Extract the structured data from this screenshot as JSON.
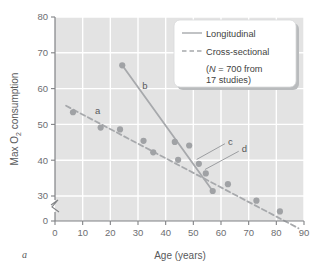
{
  "figure": {
    "panel_label": "a"
  },
  "chart_data": {
    "type": "scatter",
    "title": "",
    "xlabel": "Age (years)",
    "ylabel": "Max O2 consumption",
    "ylabel_parts": {
      "pre": "Max O",
      "sub": "2",
      "post": " consumption"
    },
    "xlim": [
      0,
      90
    ],
    "ylim": [
      0,
      80
    ],
    "y_axis_break": true,
    "y_break_between": [
      0,
      30
    ],
    "grid": true,
    "xticks": [
      0,
      10,
      20,
      30,
      40,
      50,
      60,
      70,
      80,
      90
    ],
    "yticks": [
      0,
      30,
      40,
      50,
      60,
      70,
      80
    ],
    "xtick_labels": [
      "0",
      "10",
      "20",
      "30",
      "40",
      "50",
      "60",
      "70",
      "80",
      "90"
    ],
    "ytick_labels": [
      "0",
      "30",
      "40",
      "50",
      "60",
      "70",
      "80"
    ],
    "series": [
      {
        "name": "Cross-sectional",
        "style": "dashed",
        "color": "#a7a9ac",
        "line": {
          "x0": 4,
          "y0": 55.2,
          "x1": 88,
          "y1": 21.0
        },
        "points": [
          {
            "x": 6.5,
            "y": 53.4
          },
          {
            "x": 16.5,
            "y": 49.1
          },
          {
            "x": 23.5,
            "y": 48.6
          },
          {
            "x": 32.0,
            "y": 45.4
          },
          {
            "x": 35.5,
            "y": 42.2
          },
          {
            "x": 44.5,
            "y": 40.1
          },
          {
            "x": 52.0,
            "y": 39.0
          },
          {
            "x": 54.5,
            "y": 36.3
          },
          {
            "x": 62.5,
            "y": 33.3
          },
          {
            "x": 72.8,
            "y": 28.7
          },
          {
            "x": 81.3,
            "y": 25.7
          }
        ]
      },
      {
        "name": "Longitudinal",
        "style": "solid",
        "color": "#a7a9ac",
        "line": {
          "x0": 24.3,
          "y0": 66.5,
          "x1": 57.0,
          "y1": 31.4
        },
        "points": [
          {
            "x": 24.3,
            "y": 66.5
          },
          {
            "x": 43.3,
            "y": 45.1
          },
          {
            "x": 48.5,
            "y": 44.1
          },
          {
            "x": 57.0,
            "y": 31.4
          }
        ]
      }
    ],
    "annotations": [
      {
        "label": "a",
        "x": 14.5,
        "y": 54.0,
        "leader": false
      },
      {
        "label": "b",
        "x": 31.5,
        "y": 61.0,
        "leader": false
      },
      {
        "label": "c",
        "x": 62.5,
        "y": 45.3,
        "leader": true,
        "target_x": 51.2,
        "target_y": 40.2
      },
      {
        "label": "d",
        "x": 67.5,
        "y": 43.2,
        "leader": true,
        "target_x": 54.2,
        "target_y": 37.4
      }
    ],
    "legend": {
      "position": "top-right",
      "entries": [
        {
          "label": "Longitudinal",
          "style": "solid"
        },
        {
          "label": "Cross-sectional",
          "style": "dashed"
        }
      ],
      "note_line1_pre": "(",
      "note_line1_italic": "N",
      "note_line1_post": " = 700 from",
      "note_line2": "17 studies)"
    }
  },
  "colors": {
    "plot_background": "#e3e3e3",
    "grid": "#ffffff",
    "axis": "#808285",
    "marker": "#a0a2a5",
    "series_line": "#a7a9ac",
    "legend_background": "#ffffff",
    "text": "#58595b"
  }
}
